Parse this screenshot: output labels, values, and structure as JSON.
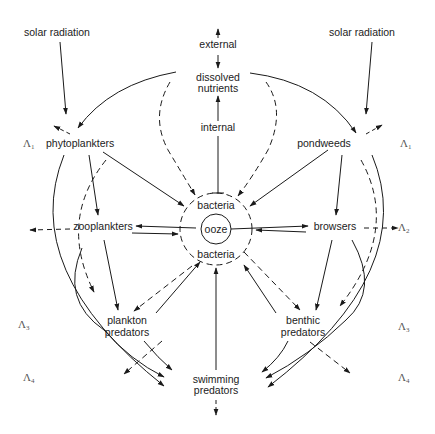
{
  "diagram": {
    "type": "trophic-dynamic food web of a senescent lake",
    "nodes": {
      "solar_left": "solar radiation",
      "solar_right": "solar radiation",
      "external": "external",
      "dissolved_1": "dissolved",
      "dissolved_2": "nutrients",
      "internal": "internal",
      "phytoplankters": "phytoplankters",
      "pondweeds": "pondweeds",
      "zooplankters": "zooplankters",
      "browsers": "browsers",
      "bacteria_top": "bacteria",
      "ooze": "ooze",
      "bacteria_bottom": "bacteria",
      "plankton_1": "plankton",
      "plankton_2": "predators",
      "benthic_1": "benthic",
      "benthic_2": "predators",
      "swimming_1": "swimming",
      "swimming_2": "predators"
    },
    "levels": {
      "symbol": "Λ",
      "left": [
        {
          "sub": "1",
          "row": "phytoplankters"
        },
        {
          "sub": "3",
          "row": "plankton predators"
        },
        {
          "sub": "4",
          "row": "swimming predators"
        }
      ],
      "right": [
        {
          "sub": "1",
          "row": "pondweeds"
        },
        {
          "sub": "2",
          "row": "browsers"
        },
        {
          "sub": "3",
          "row": "benthic predators"
        },
        {
          "sub": "4",
          "row": "swimming predators"
        }
      ]
    },
    "edges": [
      {
        "from": "solar radiation",
        "to": "phytoplankters",
        "style": "solid"
      },
      {
        "from": "solar radiation",
        "to": "pondweeds",
        "style": "solid"
      },
      {
        "from": "external",
        "to": "dissolved nutrients",
        "style": "solid",
        "bidirectional": true
      },
      {
        "from": "internal",
        "to": "dissolved nutrients",
        "style": "solid"
      },
      {
        "from": "dissolved nutrients",
        "to": "phytoplankters",
        "style": "solid"
      },
      {
        "from": "dissolved nutrients",
        "to": "pondweeds",
        "style": "solid"
      },
      {
        "from": "dissolved nutrients",
        "to": "bacteria",
        "style": "dashed"
      },
      {
        "from": "phytoplankters",
        "to": "zooplankters",
        "style": "solid"
      },
      {
        "from": "phytoplankters",
        "to": "bacteria",
        "style": "solid"
      },
      {
        "from": "pondweeds",
        "to": "browsers",
        "style": "solid"
      },
      {
        "from": "pondweeds",
        "to": "bacteria",
        "style": "solid"
      },
      {
        "from": "ooze",
        "to": "zooplankters",
        "style": "solid"
      },
      {
        "from": "zooplankters",
        "to": "bacteria",
        "style": "solid"
      },
      {
        "from": "ooze",
        "to": "browsers",
        "style": "solid"
      },
      {
        "from": "browsers",
        "to": "bacteria",
        "style": "solid"
      },
      {
        "from": "zooplankters",
        "to": "plankton predators",
        "style": "solid"
      },
      {
        "from": "browsers",
        "to": "benthic predators",
        "style": "solid"
      },
      {
        "from": "plankton predators",
        "to": "bacteria",
        "style": "solid"
      },
      {
        "from": "benthic predators",
        "to": "bacteria",
        "style": "solid"
      },
      {
        "from": "bacteria",
        "to": "plankton predators",
        "style": "dashed"
      },
      {
        "from": "bacteria",
        "to": "benthic predators",
        "style": "dashed"
      },
      {
        "from": "swimming predators",
        "to": "bacteria",
        "style": "solid"
      },
      {
        "from": "phytoplankters",
        "to": "swimming predators",
        "style": "solid"
      },
      {
        "from": "zooplankters",
        "to": "swimming predators",
        "style": "solid"
      },
      {
        "from": "plankton predators",
        "to": "swimming predators",
        "style": "solid"
      },
      {
        "from": "pondweeds",
        "to": "swimming predators",
        "style": "solid"
      },
      {
        "from": "browsers",
        "to": "swimming predators",
        "style": "solid"
      },
      {
        "from": "benthic predators",
        "to": "swimming predators",
        "style": "solid"
      }
    ]
  }
}
